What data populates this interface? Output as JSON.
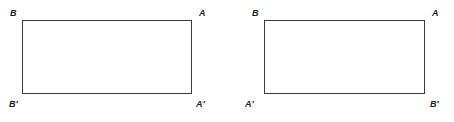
{
  "canvas": {
    "width": 454,
    "height": 122,
    "background_color": "#ffffff",
    "line_color": "#3b3b3b",
    "label_color": "#1e1e1e"
  },
  "figures": [
    {
      "name": "original-rectangle",
      "labels": {
        "top_left": "B",
        "top_right": "A",
        "bottom_left": "B′",
        "bottom_right": "A′"
      },
      "rect": {
        "x": 22,
        "y": 20,
        "width": 170,
        "height": 74
      }
    },
    {
      "name": "reflected-rectangle",
      "labels": {
        "top_left": "B",
        "top_right": "A",
        "bottom_left": "A′",
        "bottom_right": "B′"
      },
      "rect": {
        "x": 37,
        "y": 20,
        "width": 161,
        "height": 74
      }
    }
  ]
}
